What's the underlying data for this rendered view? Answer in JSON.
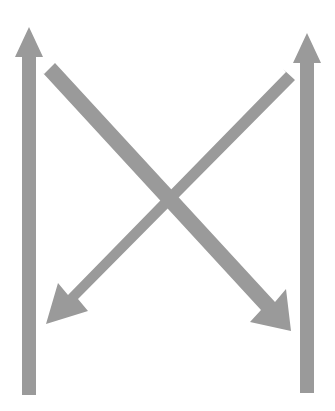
{
  "canvas": {
    "width": 335,
    "height": 411,
    "background_color": "#ffffff"
  },
  "figure": {
    "title": "",
    "arrow_fill_color": "#9a9a9a",
    "arrow_count": 4
  },
  "arrows": [
    {
      "name": "left-up-arrow",
      "direction": "up",
      "kind": "vertical",
      "fill": "#9a9a9a",
      "shaft_width": 14,
      "head_width": 28,
      "head_length": 30,
      "tip": {
        "x": 29,
        "y": 27
      },
      "tail": {
        "x": 29,
        "y": 395
      },
      "points": "29,27 43,57 36,57 36,395 22,395 22,57 15,57"
    },
    {
      "name": "right-up-arrow",
      "direction": "up",
      "kind": "vertical",
      "fill": "#9a9a9a",
      "shaft_width": 14,
      "head_width": 28,
      "head_length": 30,
      "tip": {
        "x": 307,
        "y": 33
      },
      "tail": {
        "x": 307,
        "y": 393
      },
      "points": "307,33 321,63 314,63 314,393 300,393 300,63 293,63"
    },
    {
      "name": "down-right-diagonal-arrow",
      "direction": "down-right",
      "kind": "diagonal",
      "fill": "#9a9a9a",
      "shaft_width": 15,
      "tail": {
        "x": 49,
        "y": 68
      },
      "tip": {
        "x": 291,
        "y": 331
      },
      "points": "44,74 55,63 275,302 286,289 291,331 250,322 261,310 42,72"
    },
    {
      "name": "down-left-diagonal-arrow",
      "direction": "down-left",
      "kind": "diagonal",
      "fill": "#9a9a9a",
      "shaft_width": 15,
      "tail": {
        "x": 290,
        "y": 76
      },
      "tip": {
        "x": 46,
        "y": 324
      },
      "points": "283,69 295,80 78,299 88,311 46,324 58,283 68,295 286,72"
    }
  ],
  "crossing_point": {
    "x": 172,
    "y": 200
  }
}
